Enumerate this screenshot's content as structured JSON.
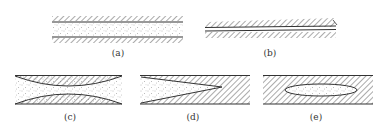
{
  "diagram": {
    "colors": {
      "line": "#333333",
      "hatch": "#555555",
      "dots": "#777777",
      "background": "#ffffff"
    },
    "panels": [
      {
        "id": "a",
        "label": "(a)",
        "shape": "parallel walls, wide gap fully stippled"
      },
      {
        "id": "b",
        "label": "(b)",
        "shape": "parallel walls, very narrow gap"
      },
      {
        "id": "c",
        "label": "(c)",
        "shape": "converging-diverging (hourglass) gap, stippled"
      },
      {
        "id": "d",
        "label": "(d)",
        "shape": "wedge-shaped gap tapering to a tip, stippled"
      },
      {
        "id": "e",
        "label": "(e)",
        "shape": "isolated lens/ellipse of stipple inside hatched solid"
      }
    ]
  }
}
